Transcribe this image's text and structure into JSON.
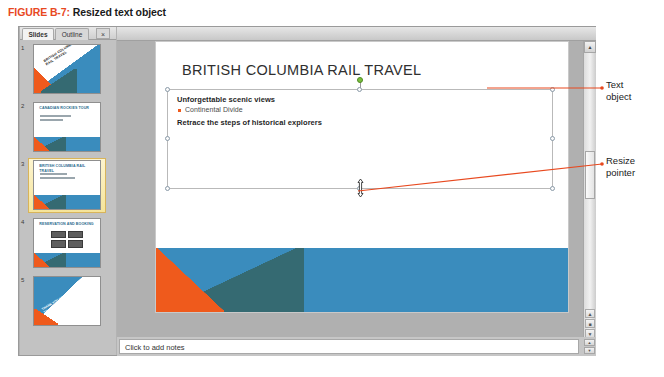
{
  "figure": {
    "label": "FIGURE B-7:",
    "title": "Resized text object"
  },
  "colors": {
    "figure_label": "#E8491F",
    "callout_line": "#E8491F",
    "slide_blue": "#3A8CBD",
    "slide_orange": "#EF5A1C",
    "slide_teal": "#356A72",
    "bullet_orange": "#EF5A1C",
    "rotate_handle_green": "#7BBF3F",
    "selected_thumb_gold": "#D8B45A"
  },
  "thumbnail_pane": {
    "tabs": [
      {
        "label": "Slides",
        "active": true
      },
      {
        "label": "Outline",
        "active": false
      }
    ],
    "close_label": "×",
    "slides": [
      {
        "number": "1",
        "layout": "title-slide",
        "title": "BRITISH COLUMBIA RAIL TRAVEL",
        "selected": false
      },
      {
        "number": "2",
        "layout": "title-and-content",
        "title": "CANADIAN ROCKIES TOUR",
        "selected": false
      },
      {
        "number": "3",
        "layout": "title-and-content",
        "title": "BRITISH COLUMBIA RAIL TRAVEL",
        "selected": true
      },
      {
        "number": "4",
        "layout": "smartart",
        "title": "RESERVATION AND BOOKING",
        "selected": false
      },
      {
        "number": "5",
        "layout": "closing-slide",
        "title": "THANK YOU FOR TRAVELING",
        "selected": false
      }
    ]
  },
  "slide": {
    "title": "BRITISH COLUMBIA RAIL TRAVEL",
    "text_object": {
      "selected": true,
      "lines": [
        {
          "text": "Unforgettable scenic views",
          "style": "heading"
        },
        {
          "text": "Continental Divide",
          "style": "bullet"
        },
        {
          "text": "Retrace the steps of historical explorers",
          "style": "heading"
        }
      ],
      "handles": [
        "top-left",
        "top-center",
        "top-right",
        "middle-left",
        "middle-right",
        "bottom-left",
        "bottom-center",
        "bottom-right"
      ],
      "rotate_handle": "rotate-handle"
    }
  },
  "scrollbar": {
    "up_arrow": "▲",
    "down_arrow": "▼",
    "prev_slide": "▲",
    "slide_show": "■",
    "next_slide": "▼"
  },
  "notes": {
    "placeholder": "Click to add notes",
    "scroll_up": "▲",
    "scroll_down": "▼"
  },
  "callouts": [
    {
      "id": "text-object",
      "label": "Text\nobject"
    },
    {
      "id": "resize-pointer",
      "label": "Resize\npointer"
    }
  ]
}
